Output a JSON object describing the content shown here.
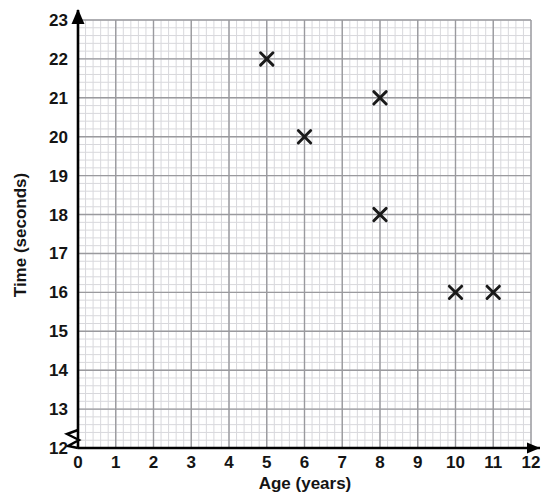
{
  "chart_data": {
    "type": "scatter",
    "title": "",
    "xlabel": "Age (years)",
    "ylabel": "Time (seconds)",
    "xlim": [
      0,
      12
    ],
    "ylim": [
      12,
      23
    ],
    "xticks": [
      0,
      1,
      2,
      3,
      4,
      5,
      6,
      7,
      8,
      9,
      10,
      11,
      12
    ],
    "yticks": [
      12,
      13,
      14,
      15,
      16,
      17,
      18,
      19,
      20,
      21,
      22,
      23
    ],
    "xtick_labels": [
      "0",
      "1",
      "2",
      "3",
      "4",
      "5",
      "6",
      "7",
      "8",
      "9",
      "10",
      "11",
      "12"
    ],
    "ytick_labels": [
      "12",
      "13",
      "14",
      "15",
      "16",
      "17",
      "18",
      "19",
      "20",
      "21",
      "22",
      "23"
    ],
    "x_minor_per_major": 5,
    "y_minor_per_major": 5,
    "grid": true,
    "legend": null,
    "y_axis_break": true,
    "marker_style": "x",
    "marker_color": "#1a1a1a",
    "points": [
      {
        "x": 5,
        "y": 22
      },
      {
        "x": 6,
        "y": 20
      },
      {
        "x": 8,
        "y": 21
      },
      {
        "x": 8,
        "y": 18
      },
      {
        "x": 10,
        "y": 16
      },
      {
        "x": 11,
        "y": 16
      }
    ]
  },
  "colors": {
    "minor_grid": "#d8d8dc",
    "major_grid": "#9a9a9e",
    "axis": "#000000",
    "text": "#141414",
    "background": "#ffffff"
  }
}
